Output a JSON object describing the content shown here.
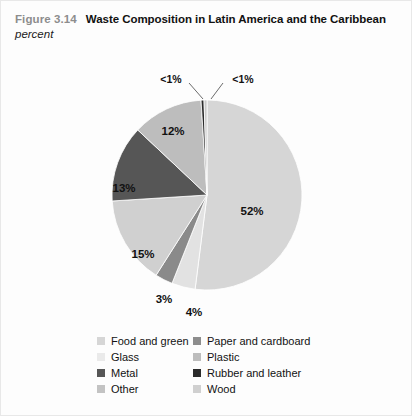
{
  "figure": {
    "number": "Figure 3.14",
    "title": "Waste Composition in Latin America and the Caribbean",
    "subtitle": "percent"
  },
  "legend": {
    "left_column": [
      {
        "label": "Food and green",
        "color": "#d6d6d6"
      },
      {
        "label": "Glass",
        "color": "#eaeaea"
      },
      {
        "label": "Metal",
        "color": "#565656"
      },
      {
        "label": "Other",
        "color": "#c3c3c3"
      }
    ],
    "right_column": [
      {
        "label": "Paper and cardboard",
        "color": "#8d8d8d"
      },
      {
        "label": "Plastic",
        "color": "#bdbdbd"
      },
      {
        "label": "Rubber and leather",
        "color": "#2b2b2b"
      },
      {
        "label": "Wood",
        "color": "#d0d0d0"
      }
    ]
  },
  "labels": {
    "s52": "52%",
    "s12": "12%",
    "s13": "13%",
    "s15": "15%",
    "s3": "3%",
    "s4": "4%",
    "lt1_left": "<1%",
    "lt1_right": "<1%"
  },
  "chart_data": {
    "type": "pie",
    "title": "Waste Composition in Latin America and the Caribbean",
    "subtitle": "percent",
    "unit": "percent",
    "legend_position": "bottom",
    "start_angle_deg": 0,
    "direction": "clockwise",
    "categories": [
      "Food and green",
      "Paper and cardboard",
      "Glass",
      "Plastic",
      "Metal",
      "Rubber and leather",
      "Other",
      "Wood"
    ],
    "values": [
      52,
      12,
      4,
      3,
      13,
      0.5,
      15,
      0.5
    ],
    "labels": [
      "52%",
      "12%",
      "4%",
      "3%",
      "13%",
      "<1%",
      "15%",
      "<1%"
    ],
    "colors": [
      "#d6d6d6",
      "#8d8d8d",
      "#eaeaea",
      "#bdbdbd",
      "#565656",
      "#2b2b2b",
      "#c3c3c3",
      "#d0d0d0"
    ],
    "slices": [
      {
        "name": "Food and green",
        "value": 52,
        "label": "52%",
        "color": "#d6d6d6"
      },
      {
        "name": "Plastic",
        "value": 4,
        "label": "4%",
        "color": "#e2e2e2"
      },
      {
        "name": "Glass",
        "value": 3,
        "label": "3%",
        "color": "#8a8a8a"
      },
      {
        "name": "Other",
        "value": 15,
        "label": "15%",
        "color": "#d0d0d0"
      },
      {
        "name": "Metal",
        "value": 13,
        "label": "13%",
        "color": "#565656"
      },
      {
        "name": "Paper and cardboard",
        "value": 12,
        "label": "12%",
        "color": "#bdbdbd"
      },
      {
        "name": "Rubber and leather",
        "value": 0.5,
        "label": "<1%",
        "color": "#2b2b2b"
      },
      {
        "name": "Wood",
        "value": 0.5,
        "label": "<1%",
        "color": "#c9c9c9"
      }
    ]
  }
}
